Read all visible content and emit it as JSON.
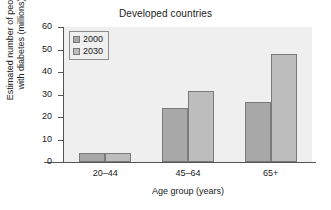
{
  "chart_data": {
    "type": "bar",
    "title": "Developed countries",
    "xlabel": "Age group (years)",
    "ylabel_lines": [
      "Estimated number of people",
      "with diabetes (millions)"
    ],
    "categories": [
      "20–44",
      "45–64",
      "65+"
    ],
    "series": [
      {
        "name": "2000",
        "values": [
          4.2,
          24,
          26.5
        ],
        "color": "#a8a8a8"
      },
      {
        "name": "2030",
        "values": [
          4.2,
          31.5,
          48
        ],
        "color": "#bdbdbd"
      }
    ],
    "ylim": [
      0,
      60
    ],
    "yticks": [
      0,
      10,
      20,
      30,
      40,
      50,
      60
    ],
    "ytick_labels": [
      "0",
      "10",
      "20",
      "30",
      "40",
      "50",
      "60"
    ],
    "grid": false,
    "legend_position": "upper left",
    "plot_background": "#efefef",
    "axis_color": "#555555"
  }
}
